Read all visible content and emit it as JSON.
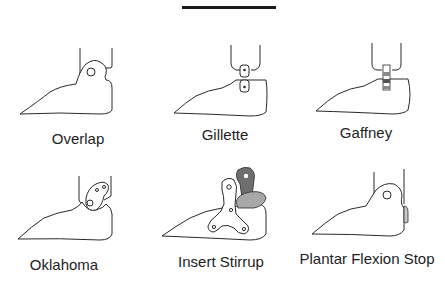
{
  "figure": {
    "divider": "top-rule",
    "panels": [
      {
        "id": "overlap",
        "label": "Overlap"
      },
      {
        "id": "gillette",
        "label": "Gillette"
      },
      {
        "id": "gaffney",
        "label": "Gaffney"
      },
      {
        "id": "oklahoma",
        "label": "Oklahoma"
      },
      {
        "id": "insert-stirrup",
        "label": "Insert Stirrup"
      },
      {
        "id": "plantar-flexion-stop",
        "label": "Plantar Flexion Stop"
      }
    ],
    "colors": {
      "line": "#2a2a2a",
      "stirrup_dark": "#6e6e6e",
      "stirrup_light": "#a8a8a8",
      "hinge_gray": "#8a8a8a"
    }
  }
}
